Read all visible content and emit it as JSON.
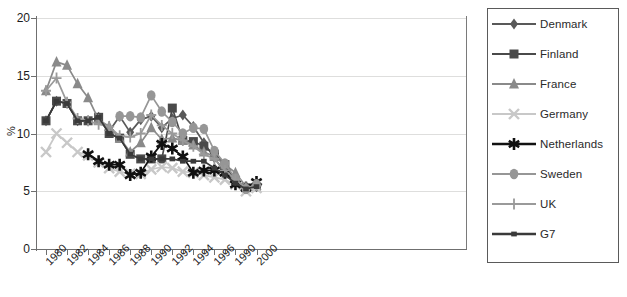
{
  "chart_data": {
    "type": "line",
    "title": "",
    "xlabel": "",
    "ylabel": "%",
    "ylim": [
      0,
      20
    ],
    "yticks": [
      0,
      5,
      10,
      15,
      20
    ],
    "grid": true,
    "legend_position": "right",
    "x": [
      1980,
      1981,
      1982,
      1983,
      1984,
      1985,
      1986,
      1987,
      1988,
      1989,
      1990,
      1991,
      1992,
      1993,
      1994,
      1995,
      1996,
      1997,
      1998,
      1999,
      2000
    ],
    "xtick_labels": [
      "1980",
      "1982",
      "1984",
      "1986",
      "1988",
      "1990",
      "1992",
      "1994",
      "1996",
      "1990",
      "2000"
    ],
    "xtick_years": [
      1980,
      1982,
      1984,
      1986,
      1988,
      1990,
      1992,
      1994,
      1996,
      1998,
      2000
    ],
    "series": [
      {
        "name": "Denmark",
        "marker": "diamond",
        "color": "#595959",
        "values": [
          11.1,
          12.8,
          12.6,
          11.1,
          11.1,
          11.4,
          10.2,
          11.5,
          10.1,
          11.2,
          11.5,
          10.5,
          11.3,
          11.6,
          10.6,
          9.2,
          7.9,
          6.6,
          5.9,
          5.3,
          5.4
        ]
      },
      {
        "name": "Finland",
        "marker": "square",
        "color": "#4a4a4a",
        "values": [
          11.1,
          12.8,
          12.6,
          11.1,
          11.1,
          11.4,
          10.0,
          9.6,
          8.2,
          7.8,
          7.8,
          7.8,
          12.2,
          9.4,
          9.3,
          8.9,
          8.2,
          7.3,
          5.9,
          5.3,
          5.4
        ]
      },
      {
        "name": "France",
        "marker": "triangle",
        "color": "#8a8a8a",
        "values": [
          13.7,
          16.2,
          15.9,
          14.3,
          13.1,
          11.2,
          10.6,
          9.6,
          8.4,
          9.2,
          10.5,
          9.5,
          9.6,
          9.4,
          9.0,
          8.4,
          8.0,
          7.3,
          6.6,
          5.4,
          5.5
        ]
      },
      {
        "name": "Germany",
        "marker": "cross",
        "color": "#c8c8c8",
        "values": [
          8.4,
          10.0,
          9.2,
          8.4,
          8.1,
          7.5,
          7.0,
          6.7,
          6.5,
          6.5,
          6.9,
          7.1,
          7.0,
          6.7,
          6.6,
          6.4,
          6.2,
          6.0,
          5.6,
          5.0,
          5.3
        ]
      },
      {
        "name": "Netherlands",
        "marker": "asterisk",
        "color": "#111111",
        "values": [
          null,
          null,
          null,
          null,
          8.2,
          7.6,
          7.3,
          7.3,
          6.4,
          6.6,
          8.0,
          9.1,
          8.7,
          8.0,
          6.6,
          6.8,
          6.8,
          6.6,
          5.6,
          5.3,
          5.8
        ]
      },
      {
        "name": "Sweden",
        "marker": "circle",
        "color": "#969696",
        "values": [
          null,
          null,
          null,
          null,
          null,
          null,
          null,
          11.5,
          11.5,
          11.4,
          13.3,
          11.9,
          11.0,
          10.0,
          10.5,
          10.4,
          8.5,
          7.4,
          6.1,
          5.2,
          5.6
        ]
      },
      {
        "name": "UK",
        "marker": "plus",
        "color": "#9a9a9a",
        "values": [
          13.7,
          14.8,
          12.7,
          11.3,
          11.1,
          10.8,
          10.6,
          9.8,
          9.7,
          10.0,
          11.6,
          10.7,
          10.0,
          9.4,
          8.9,
          8.2,
          7.8,
          6.8,
          6.0,
          5.3,
          5.5
        ]
      },
      {
        "name": "G7",
        "marker": "small-square",
        "color": "#3a3a3a",
        "values": [
          11.1,
          12.8,
          12.6,
          11.1,
          11.1,
          11.4,
          10.0,
          9.6,
          8.2,
          7.8,
          7.8,
          7.8,
          7.8,
          7.6,
          7.6,
          7.6,
          7.0,
          6.4,
          5.7,
          5.2,
          5.4
        ]
      }
    ]
  },
  "legend": {
    "items": [
      {
        "label": "Denmark",
        "icon": "diamond-marker-icon"
      },
      {
        "label": "Finland",
        "icon": "square-marker-icon"
      },
      {
        "label": "France",
        "icon": "triangle-marker-icon"
      },
      {
        "label": "Germany",
        "icon": "cross-marker-icon"
      },
      {
        "label": "Netherlands",
        "icon": "asterisk-marker-icon"
      },
      {
        "label": "Sweden",
        "icon": "circle-marker-icon"
      },
      {
        "label": "UK",
        "icon": "plus-marker-icon"
      },
      {
        "label": "G7",
        "icon": "small-square-marker-icon"
      }
    ]
  },
  "axes": {
    "y_title": "%",
    "y_labels": [
      "20",
      "15",
      "10",
      "5",
      "0"
    ],
    "x_labels": [
      "1980",
      "1982",
      "1984",
      "1986",
      "1988",
      "1990",
      "1992",
      "1994",
      "1996",
      "1990",
      "2000"
    ]
  }
}
